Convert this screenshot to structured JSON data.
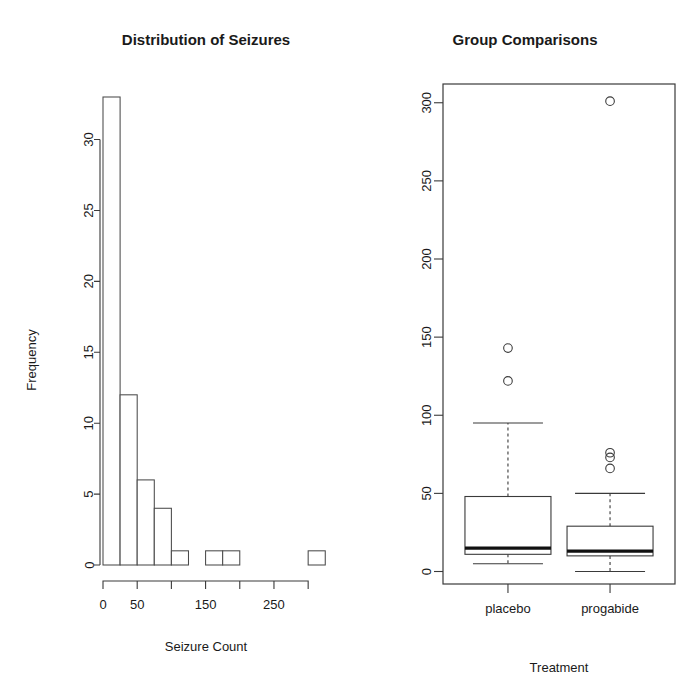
{
  "chart_data": [
    {
      "type": "bar",
      "panel": "histogram",
      "title": "Distribution of Seizures",
      "xlabel": "Seizure Count",
      "ylabel": "Frequency",
      "xlim": [
        0,
        310
      ],
      "ylim": [
        0,
        33
      ],
      "grid": false,
      "legend": "none",
      "bin_width": 25,
      "bin_starts": [
        0,
        25,
        50,
        75,
        100,
        125,
        150,
        175,
        200,
        225,
        250,
        275,
        300
      ],
      "categories": [
        "0-25",
        "25-50",
        "50-75",
        "75-100",
        "100-125",
        "125-150",
        "150-175",
        "175-200",
        "200-225",
        "225-250",
        "250-275",
        "275-300",
        "300-325"
      ],
      "values": [
        33,
        12,
        6,
        4,
        1,
        0,
        1,
        1,
        0,
        0,
        0,
        0,
        1
      ],
      "xticks": [
        0,
        50,
        100,
        150,
        200,
        250,
        300
      ],
      "xtick_labels": [
        "0",
        "50",
        "",
        "150",
        "",
        "250",
        ""
      ],
      "yticks": [
        0,
        5,
        10,
        15,
        20,
        25,
        30
      ],
      "ytick_labels": [
        "0",
        "5",
        "10",
        "15",
        "20",
        "25",
        "30"
      ]
    },
    {
      "type": "boxplot",
      "panel": "boxplot",
      "title": "Group Comparisons",
      "xlabel": "Treatment",
      "ylabel": "",
      "ylim": [
        -8,
        312
      ],
      "grid": false,
      "legend": "none",
      "categories": [
        "placebo",
        "progabide"
      ],
      "yticks": [
        0,
        50,
        100,
        150,
        200,
        250,
        300
      ],
      "ytick_labels": [
        "0",
        "50",
        "100",
        "150",
        "200",
        "250",
        "300"
      ],
      "boxes": [
        {
          "name": "placebo",
          "whisker_low": 5,
          "q1": 11,
          "median": 15,
          "q3": 48,
          "whisker_high": 95,
          "outliers": [
            122,
            143
          ]
        },
        {
          "name": "progabide",
          "whisker_low": 0,
          "q1": 10,
          "median": 13,
          "q3": 29,
          "whisker_high": 50,
          "outliers": [
            66,
            73,
            76,
            301
          ]
        }
      ]
    }
  ],
  "histogram": {
    "title": "Distribution of Seizures",
    "xlabel": "Seizure Count",
    "ylabel": "Frequency"
  },
  "boxplot": {
    "title": "Group Comparisons",
    "xlabel": "Treatment",
    "tick_labels": [
      "placebo",
      "progabide"
    ]
  },
  "colors": {
    "background": "#ffffff",
    "ink": "#1a1a1a",
    "axis": "#3a3a3a",
    "bar_fill": "#ffffff",
    "bar_stroke": "#4a4a4a",
    "median": "#111111"
  }
}
